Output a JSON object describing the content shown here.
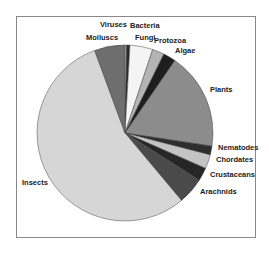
{
  "chart_data": {
    "type": "pie",
    "title": "",
    "start_angle_deg": 0,
    "direction": "clockwise",
    "center": [
      125,
      133
    ],
    "radius": 88,
    "slices": [
      {
        "label": "Viruses",
        "value": 0.3,
        "color": "#c8c8c8",
        "lx": 100,
        "ly": 27,
        "anchor": "start"
      },
      {
        "label": "Bacteria",
        "value": 0.6,
        "color": "#2a2a2a",
        "lx": 130,
        "ly": 28,
        "anchor": "start"
      },
      {
        "label": "Fungi",
        "value": 4.2,
        "color": "#f4f4f4",
        "lx": 135,
        "ly": 40,
        "anchor": "start"
      },
      {
        "label": "Protozoa",
        "value": 2.2,
        "color": "#b4b4b4",
        "lx": 154,
        "ly": 43,
        "anchor": "start"
      },
      {
        "label": "Algae",
        "value": 2.3,
        "color": "#1e1e1e",
        "lx": 175,
        "ly": 53,
        "anchor": "start"
      },
      {
        "label": "Plants",
        "value": 17.8,
        "color": "#8c8c8c",
        "lx": 210,
        "ly": 92,
        "anchor": "start"
      },
      {
        "label": "Nematodes",
        "value": 1.6,
        "color": "#2e2e2e",
        "lx": 218,
        "ly": 150,
        "anchor": "start"
      },
      {
        "label": "Chordates",
        "value": 2.6,
        "color": "#c4c4c4",
        "lx": 216,
        "ly": 162,
        "anchor": "start"
      },
      {
        "label": "Crustaceans",
        "value": 2.4,
        "color": "#262626",
        "lx": 210,
        "ly": 177,
        "anchor": "start"
      },
      {
        "label": "Arachnids",
        "value": 4.9,
        "color": "#4a4a4a",
        "lx": 200,
        "ly": 194,
        "anchor": "start"
      },
      {
        "label": "Insects",
        "value": 55.5,
        "color": "#d6d6d6",
        "lx": 22,
        "ly": 185,
        "anchor": "start"
      },
      {
        "label": "Molluscs",
        "value": 5.6,
        "color": "#6e6e6e",
        "lx": 86,
        "ly": 40,
        "anchor": "start"
      }
    ],
    "legend": "none",
    "labels_position": "outside"
  }
}
